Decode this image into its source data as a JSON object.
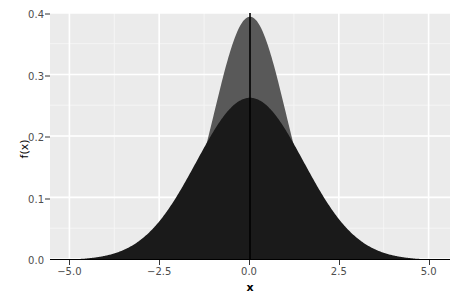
{
  "chart_data": {
    "type": "area",
    "title": "",
    "subtitle": "",
    "xlabel": "x",
    "ylabel": "f(x)",
    "xlim": [
      -5.6,
      5.6
    ],
    "ylim": [
      0.0,
      0.405
    ],
    "grid": true,
    "legend_position": "none",
    "x_ticks": [
      {
        "value": -5.0,
        "label": "−5.0"
      },
      {
        "value": -2.5,
        "label": "−2.5"
      },
      {
        "value": 0.0,
        "label": "0.0"
      },
      {
        "value": 2.5,
        "label": "2.5"
      },
      {
        "value": 5.0,
        "label": "5.0"
      }
    ],
    "y_ticks": [
      {
        "value": 0.0,
        "label": "0.0"
      },
      {
        "value": 0.1,
        "label": "0.1"
      },
      {
        "value": 0.2,
        "label": "0.2"
      },
      {
        "value": 0.3,
        "label": "0.3"
      },
      {
        "value": 0.4,
        "label": "0.4"
      }
    ],
    "x_minor_ticks": [
      -3.75,
      -1.25,
      1.25,
      3.75
    ],
    "y_minor_ticks": [
      0.05,
      0.15,
      0.25,
      0.35
    ],
    "series": [
      {
        "name": "normal-sd-1",
        "kind": "density-area",
        "distribution": "normal",
        "mean": 0.0,
        "sd": 1.0,
        "peak": 0.3989,
        "fill": "#595959",
        "x": [
          -5.6,
          -5.2,
          -4.8,
          -4.4,
          -4.0,
          -3.6,
          -3.2,
          -2.8,
          -2.4,
          -2.0,
          -1.6,
          -1.2,
          -0.8,
          -0.4,
          0.0,
          0.4,
          0.8,
          1.2,
          1.6,
          2.0,
          2.4,
          2.8,
          3.2,
          3.6,
          4.0,
          4.4,
          4.8,
          5.2,
          5.6
        ],
        "values": [
          0.0,
          0.0,
          0.0,
          0.0001,
          0.0001,
          0.0006,
          0.0024,
          0.0079,
          0.0224,
          0.054,
          0.1109,
          0.1942,
          0.2897,
          0.3683,
          0.3989,
          0.3683,
          0.2897,
          0.1942,
          0.1109,
          0.054,
          0.0224,
          0.0079,
          0.0024,
          0.0006,
          0.0001,
          0.0001,
          0.0,
          0.0,
          0.0
        ]
      },
      {
        "name": "normal-sd-1-5",
        "kind": "density-area",
        "distribution": "normal",
        "mean": 0.0,
        "sd": 1.5,
        "peak": 0.266,
        "fill": "#1a1a1a",
        "x": [
          -5.6,
          -5.2,
          -4.8,
          -4.4,
          -4.0,
          -3.6,
          -3.2,
          -2.8,
          -2.4,
          -2.0,
          -1.6,
          -1.2,
          -0.8,
          -0.4,
          0.0,
          0.4,
          0.8,
          1.2,
          1.6,
          2.0,
          2.4,
          2.8,
          3.2,
          3.6,
          4.0,
          4.4,
          4.8,
          5.2,
          5.6
        ],
        "values": [
          0.0008,
          0.0018,
          0.0038,
          0.0074,
          0.0133,
          0.0224,
          0.0352,
          0.0516,
          0.0707,
          0.0905,
          0.108,
          0.1206,
          0.1258,
          0.1226,
          0.266,
          0.1226,
          0.1258,
          0.1206,
          0.108,
          0.0905,
          0.0707,
          0.0516,
          0.0352,
          0.0224,
          0.0133,
          0.0074,
          0.0038,
          0.0018,
          0.0008
        ]
      }
    ],
    "annotations": [
      {
        "name": "vertical-line-at-zero",
        "type": "vline",
        "x": 0.0,
        "color": "#000000",
        "width": 1.5
      },
      {
        "name": "baseline-at-zero",
        "type": "hline",
        "y": 0.0,
        "color": "#000000",
        "width": 1.5
      }
    ],
    "colors": {
      "panel_background": "#ebebeb",
      "grid_major": "#ffffff",
      "grid_minor": "#f5f5f5",
      "plot_background": "#ffffff",
      "axis_text": "#4d4d4d",
      "axis_title": "#000000",
      "tick_mark": "#333333",
      "series_light": "#595959",
      "series_dark": "#1a1a1a"
    }
  }
}
